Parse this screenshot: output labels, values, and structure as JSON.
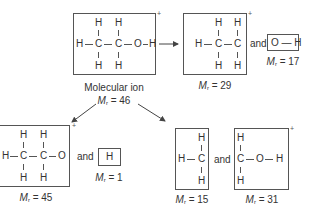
{
  "diagram": {
    "molecular_ion": {
      "label": "Molecular ion",
      "mr_symbol": "M",
      "mr_subscript": "r",
      "mr_value": "= 46",
      "charge": "+",
      "atoms": {
        "h": "H",
        "c": "C",
        "o": "O"
      }
    },
    "fragmentation_1": {
      "fragment_a": {
        "mr_value": "= 29",
        "charge": "+",
        "formula": "CH3CH2"
      },
      "joiner": "and",
      "fragment_b": {
        "mr_value": "= 17",
        "formula": "OH",
        "text": "O — H"
      }
    },
    "fragmentation_2": {
      "fragment_a": {
        "mr_value": "= 45",
        "charge": "+",
        "formula": "CH3CH2O"
      },
      "joiner": "and",
      "fragment_b": {
        "mr_value": "= 1",
        "formula": "H",
        "text": "H"
      }
    },
    "fragmentation_3": {
      "fragment_a": {
        "mr_value": "= 15",
        "formula": "CH3"
      },
      "joiner": "and",
      "fragment_b": {
        "mr_value": "= 31",
        "charge": "+",
        "formula": "CH2OH"
      }
    },
    "colors": {
      "line": "#555555",
      "text": "#333333",
      "background": "#ffffff"
    }
  }
}
